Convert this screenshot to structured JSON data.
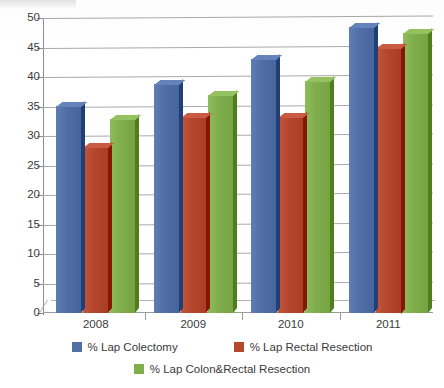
{
  "chart_data": {
    "type": "bar",
    "title": "",
    "subtitle": "",
    "xlabel": "",
    "ylabel": "",
    "categories": [
      "2008",
      "2009",
      "2010",
      "2011"
    ],
    "series": [
      {
        "name": "% Lap Colectomy",
        "color": "#4f6fa6",
        "values": [
          35.1,
          38.8,
          43.0,
          48.5
        ]
      },
      {
        "name": "% Lap Rectal Resection",
        "color": "#b5472f",
        "values": [
          28.2,
          33.3,
          33.3,
          45.0
        ]
      },
      {
        "name": "% Lap Colon&Rectal Resection",
        "color": "#80ae4c",
        "values": [
          32.8,
          36.9,
          39.3,
          47.4
        ]
      }
    ],
    "ylim": [
      0,
      50
    ],
    "ytick_step": 5,
    "ytick_labels": [
      "50",
      "45",
      "40",
      "35",
      "30",
      "25",
      "20",
      "15",
      "10",
      "5",
      "0"
    ],
    "grid": true,
    "legend_position": "bottom",
    "style": "3d-column"
  },
  "axis": {
    "y_tick_labels": [
      "50",
      "45",
      "40",
      "35",
      "30",
      "25",
      "20",
      "15",
      "10",
      "5",
      "0"
    ],
    "x_tick_labels": [
      "2008",
      "2009",
      "2010",
      "2011"
    ]
  },
  "legend": {
    "items": [
      {
        "label": "% Lap Colectomy",
        "color": "#4f6fa6",
        "swatch_name": "legend-swatch-blue"
      },
      {
        "label": "% Lap Rectal Resection",
        "color": "#b5472f",
        "swatch_name": "legend-swatch-red"
      },
      {
        "label": "% Lap Colon&Rectal Resection",
        "color": "#80ae4c",
        "swatch_name": "legend-swatch-green"
      }
    ]
  }
}
